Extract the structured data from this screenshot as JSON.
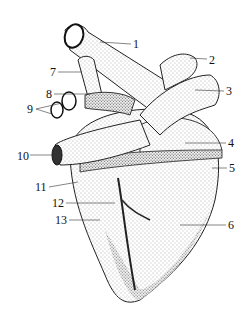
{
  "figure": {
    "colors": {
      "ink": "#111111",
      "background": "#ffffff",
      "stipple": "#555555"
    },
    "labels": [
      {
        "n": "1",
        "x": 133,
        "y": 38
      },
      {
        "n": "2",
        "x": 209,
        "y": 54
      },
      {
        "n": "3",
        "x": 226,
        "y": 85
      },
      {
        "n": "4",
        "x": 228,
        "y": 137
      },
      {
        "n": "5",
        "x": 229,
        "y": 162
      },
      {
        "n": "6",
        "x": 228,
        "y": 219
      },
      {
        "n": "7",
        "x": 50,
        "y": 66
      },
      {
        "n": "8",
        "x": 46,
        "y": 88
      },
      {
        "n": "9",
        "x": 27,
        "y": 103
      },
      {
        "n": "10",
        "x": 17,
        "y": 150
      },
      {
        "n": "11",
        "x": 35,
        "y": 181
      },
      {
        "n": "12",
        "x": 52,
        "y": 197
      },
      {
        "n": "13",
        "x": 55,
        "y": 214
      }
    ]
  }
}
